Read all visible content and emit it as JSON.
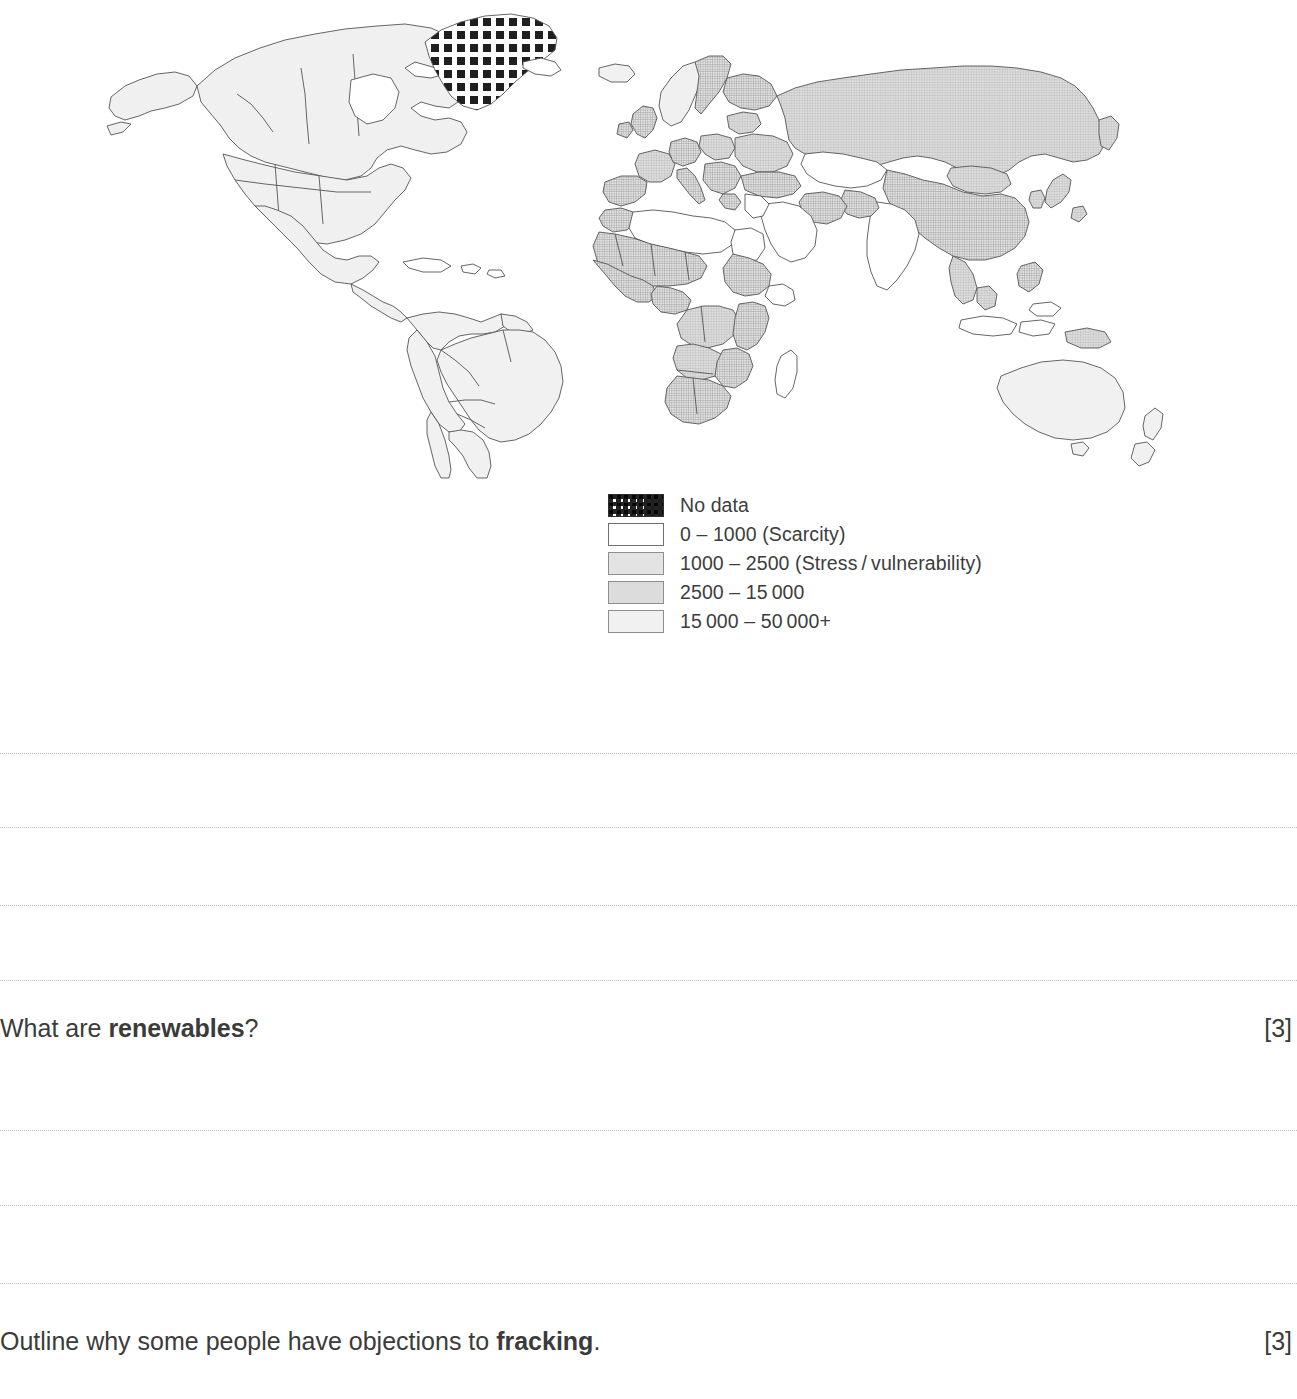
{
  "page": {
    "background_color": "#ffffff",
    "text_color": "#3b3b3b"
  },
  "map": {
    "title": "",
    "type": "choropleth world map",
    "subject": "Annual renewable water resources per capita",
    "no_data_regions": [
      "Greenland"
    ]
  },
  "legend": {
    "items": [
      {
        "label": "No data",
        "swatch": "checkered-pattern",
        "color": "#1e1e1e"
      },
      {
        "label": "0 – 1000 (Scarcity)",
        "swatch": "white-fill",
        "color": "#ffffff"
      },
      {
        "label": "1000 – 2500 (Stress / vulnerability)",
        "swatch": "grid-texture-medium",
        "color": "#e3e3e3"
      },
      {
        "label": "2500 – 15 000",
        "swatch": "grid-texture-light",
        "color": "#dcdcdc"
      },
      {
        "label": "15 000 – 50 000+",
        "swatch": "very-light-fill",
        "color": "#f1f1f1"
      }
    ]
  },
  "answer_lines": {
    "group_one_y": [
      753,
      827,
      905,
      980
    ],
    "group_two_y": [
      1130,
      1205,
      1283
    ]
  },
  "questions": [
    {
      "id": "renewables",
      "prefix": "What are ",
      "bold": "renewables",
      "suffix": "?",
      "marks": "[3]"
    },
    {
      "id": "fracking",
      "prefix": "Outline why some people have objections to ",
      "bold": "fracking",
      "suffix": ".",
      "marks": "[3]"
    }
  ]
}
